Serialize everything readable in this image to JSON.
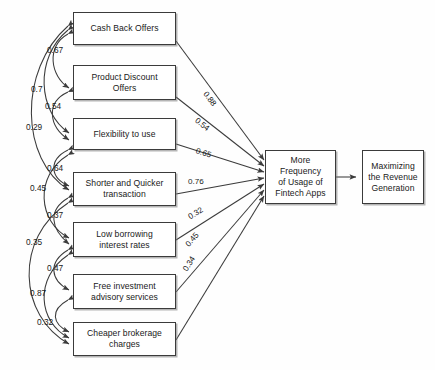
{
  "diagram": {
    "type": "path-diagram",
    "predictors": [
      {
        "id": "cash-back-offers",
        "label": "Cash Back Offers"
      },
      {
        "id": "product-discount-offers",
        "label": "Product Discount\nOffers"
      },
      {
        "id": "flexibility-to-use",
        "label": "Flexibility to use"
      },
      {
        "id": "shorter-and-quicker-transaction",
        "label": "Shorter and Quicker\ntransaction"
      },
      {
        "id": "low-borrowing-interest-rates",
        "label": "Low borrowing\ninterest rates"
      },
      {
        "id": "free-investment-advisory-services",
        "label": "Free investment\nadvisory services"
      },
      {
        "id": "cheaper-brokerage-charges",
        "label": "Cheaper brokerage\ncharges"
      }
    ],
    "mediator": {
      "id": "more-frequency-of-usage-of-fintech-apps",
      "label": "More Frequency\nof Usage of\nFintech Apps"
    },
    "outcome": {
      "id": "maximizing-the-revenue-generation",
      "label": "Maximizing\nthe Revenue\nGeneration"
    },
    "path_coefficients": [
      {
        "from": "cash-back-offers",
        "to": "more-frequency-of-usage-of-fintech-apps",
        "value": "0.88"
      },
      {
        "from": "product-discount-offers",
        "to": "more-frequency-of-usage-of-fintech-apps",
        "value": "0.54"
      },
      {
        "from": "flexibility-to-use",
        "to": "more-frequency-of-usage-of-fintech-apps",
        "value": "0.65"
      },
      {
        "from": "shorter-and-quicker-transaction",
        "to": "more-frequency-of-usage-of-fintech-apps",
        "value": "0.76"
      },
      {
        "from": "low-borrowing-interest-rates",
        "to": "more-frequency-of-usage-of-fintech-apps",
        "value": "0.32"
      },
      {
        "from": "free-investment-advisory-services",
        "to": "more-frequency-of-usage-of-fintech-apps",
        "value": "0.45"
      },
      {
        "from": "cheaper-brokerage-charges",
        "to": "more-frequency-of-usage-of-fintech-apps",
        "value": "0.34"
      }
    ],
    "correlations": [
      {
        "id": "corr-067",
        "value": "0.67"
      },
      {
        "id": "corr-07",
        "value": "0.7"
      },
      {
        "id": "corr-054",
        "value": "0.54"
      },
      {
        "id": "corr-029",
        "value": "0.29"
      },
      {
        "id": "corr-064",
        "value": "0.64"
      },
      {
        "id": "corr-045",
        "value": "0.45"
      },
      {
        "id": "corr-037",
        "value": "0.37"
      },
      {
        "id": "corr-035",
        "value": "0.35"
      },
      {
        "id": "corr-047",
        "value": "0.47"
      },
      {
        "id": "corr-087",
        "value": "0.87"
      },
      {
        "id": "corr-032",
        "value": "0.32"
      }
    ],
    "colors": {
      "stroke": "#3b3b3b",
      "text": "#1a1a1a",
      "background": "#fefefe"
    }
  }
}
